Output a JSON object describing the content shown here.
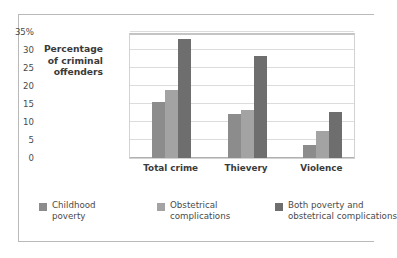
{
  "chart_data": {
    "type": "bar",
    "title": "",
    "subtitle": "",
    "xlabel": "",
    "ylabel": "Percentage of criminal offenders",
    "ylabel_lines": [
      "Percentage",
      "of criminal",
      "offenders"
    ],
    "categories": [
      "Total crime",
      "Thievery",
      "Violence"
    ],
    "series": [
      {
        "name": "Childhood poverty",
        "name_lines": [
          "Childhood",
          "poverty"
        ],
        "color": "#8c8c8c",
        "values": [
          15.5,
          12.2,
          3.6
        ]
      },
      {
        "name": "Obstetrical complications",
        "name_lines": [
          "Obstetrical",
          "complications"
        ],
        "color": "#a3a3a3",
        "values": [
          19.0,
          13.4,
          7.5
        ]
      },
      {
        "name": "Both poverty and obstetrical complications",
        "name_lines": [
          "Both poverty and",
          "obstetrical complications"
        ],
        "color": "#6e6e6e",
        "values": [
          33.0,
          28.3,
          12.9
        ]
      }
    ],
    "ylim": [
      0,
      35
    ],
    "yticks": [
      0,
      5,
      10,
      15,
      20,
      25,
      30,
      35
    ],
    "ytick_labels": [
      "0",
      "5",
      "10",
      "15",
      "20",
      "25",
      "30",
      "35%"
    ],
    "grid": true,
    "legend_position": "bottom"
  },
  "colors": {
    "frame_border": "#b9b9b9",
    "plot_border": "#d2d2d2",
    "gridline": "#dcdcdc",
    "axis_text": "#4a4a4a",
    "title_text": "#3a3a3a",
    "background": "#ffffff"
  }
}
